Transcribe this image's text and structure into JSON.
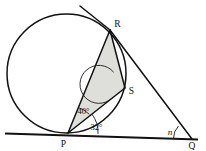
{
  "figure": {
    "background_color": "#ffffff",
    "line_color": "#111111",
    "shade_color": "#dededa"
  },
  "points": {
    "P": {
      "label": "P",
      "x": 68,
      "y": 133
    },
    "Q": {
      "label": "Q",
      "x": 191,
      "y": 139
    },
    "R": {
      "label": "R",
      "x": 110,
      "y": 30
    },
    "S": {
      "label": "S",
      "x": 125,
      "y": 88
    }
  },
  "labels": {
    "P": "P",
    "Q": "Q",
    "R": "R",
    "S": "S"
  },
  "angles": {
    "angle_RPS": "40°",
    "angle_SPQ": "32°",
    "angle_at_Q": "n",
    "angle_at_S_marked": ""
  },
  "elements": {
    "circle_name": "circle",
    "tangent_name": "tangent-line-at-R",
    "baseline_name": "tangent-line-PQ",
    "shaded_region_name": "shaded-triangle-PRS"
  }
}
